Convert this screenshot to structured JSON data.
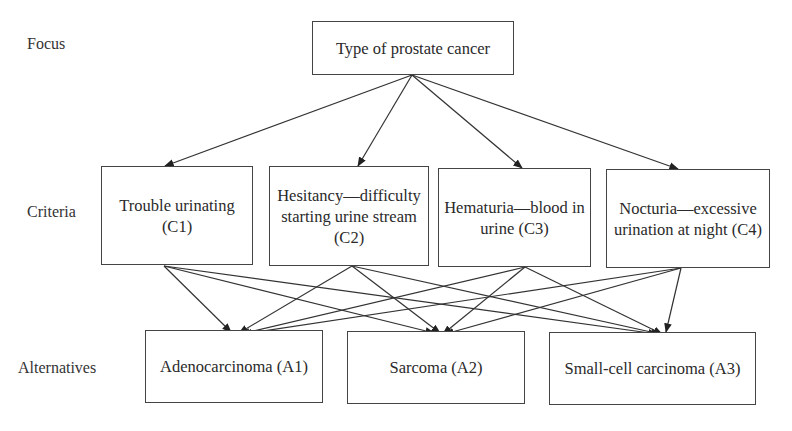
{
  "levels": {
    "focus": "Focus",
    "criteria": "Criteria",
    "alternatives": "Alternatives"
  },
  "goal": {
    "id": "G",
    "label": "Type of prostate cancer"
  },
  "criteria": [
    {
      "id": "C1",
      "label": "Trouble urinating (C1)"
    },
    {
      "id": "C2",
      "label": "Hesitancy—difficulty starting urine stream (C2)"
    },
    {
      "id": "C3",
      "label": "Hematuria—blood in urine (C3)"
    },
    {
      "id": "C4",
      "label": "Nocturia—excessive urination at night (C4)"
    }
  ],
  "alternatives": [
    {
      "id": "A1",
      "label": "Adenocarcinoma (A1)"
    },
    {
      "id": "A2",
      "label": "Sarcoma (A2)"
    },
    {
      "id": "A3",
      "label": "Small-cell carcinoma (A3)"
    }
  ],
  "edges": [
    [
      "G",
      "C1"
    ],
    [
      "G",
      "C2"
    ],
    [
      "G",
      "C3"
    ],
    [
      "G",
      "C4"
    ],
    [
      "C1",
      "A1"
    ],
    [
      "C1",
      "A2"
    ],
    [
      "C1",
      "A3"
    ],
    [
      "C2",
      "A1"
    ],
    [
      "C2",
      "A2"
    ],
    [
      "C2",
      "A3"
    ],
    [
      "C3",
      "A1"
    ],
    [
      "C3",
      "A2"
    ],
    [
      "C3",
      "A3"
    ],
    [
      "C4",
      "A1"
    ],
    [
      "C4",
      "A2"
    ],
    [
      "C4",
      "A3"
    ]
  ]
}
